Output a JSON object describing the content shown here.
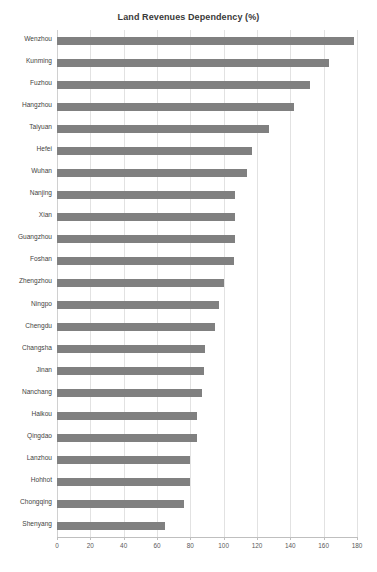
{
  "chart_data": {
    "type": "bar",
    "orientation": "horizontal",
    "title": "Land Revenues Dependency (%)",
    "xlabel": "",
    "ylabel": "",
    "xlim": [
      0,
      180
    ],
    "xticks": [
      0,
      20,
      40,
      60,
      80,
      100,
      120,
      140,
      160,
      180
    ],
    "grid": "vertical",
    "legend": "none",
    "bar_color": "#808080",
    "categories": [
      "Wenzhou",
      "Kunming",
      "Fuzhou",
      "Hangzhou",
      "Taiyuan",
      "Hefei",
      "Wuhan",
      "Nanjing",
      "Xian",
      "Guangzhou",
      "Foshan",
      "Zhengzhou",
      "Ningpo",
      "Chengdu",
      "Changsha",
      "Jinan",
      "Nanchang",
      "Haikou",
      "Qingdao",
      "Lanzhou",
      "Hohhot",
      "Chongqing",
      "Shenyang"
    ],
    "values": [
      178,
      163,
      152,
      142,
      127,
      117,
      114,
      107,
      107,
      107,
      106,
      100,
      97,
      95,
      89,
      88,
      87,
      84,
      84,
      80,
      80,
      76,
      65
    ]
  }
}
